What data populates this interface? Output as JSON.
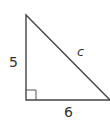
{
  "diagram": {
    "type": "right-triangle",
    "stroke_color": "#444444",
    "vertices": {
      "top": [
        26,
        15
      ],
      "right_angle": [
        26,
        100
      ],
      "right": [
        110,
        100
      ]
    },
    "right_angle_marker_size": 10,
    "labels": {
      "vertical_leg": "5",
      "horizontal_leg": "6",
      "hypotenuse": "c"
    }
  }
}
